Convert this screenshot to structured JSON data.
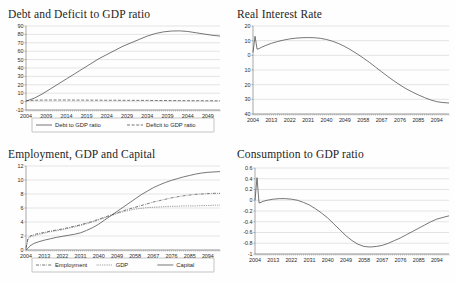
{
  "page": {
    "background": "#fefefe",
    "layout": "2x2 chart grid"
  },
  "panels": [
    {
      "id": "debt",
      "title": "Debt and Deficit to GDP ratio"
    },
    {
      "id": "rir",
      "title": "Real Interest Rate"
    },
    {
      "id": "egc",
      "title": "Employment, GDP and Capital"
    },
    {
      "id": "cgdp",
      "title": "Consumption to GDP ratio"
    }
  ],
  "chart_data": [
    {
      "id": "debt",
      "type": "line",
      "title": "Debt and Deficit to GDP ratio",
      "xlabel": "",
      "ylabel": "",
      "grid": true,
      "legend_position": "below",
      "xlim": [
        2004,
        2052
      ],
      "ylim": [
        -10,
        90
      ],
      "yticks": [
        -10,
        0,
        10,
        20,
        30,
        40,
        50,
        60,
        70,
        80,
        90
      ],
      "xticks": [
        2004,
        2009,
        2014,
        2019,
        2024,
        2029,
        2034,
        2039,
        2044,
        2049
      ],
      "x": [
        2004,
        2006,
        2008,
        2010,
        2012,
        2014,
        2016,
        2018,
        2020,
        2022,
        2024,
        2026,
        2028,
        2030,
        2032,
        2034,
        2036,
        2038,
        2040,
        2042,
        2044,
        2046,
        2048,
        2050,
        2052
      ],
      "series": [
        {
          "name": "Debt to GDP ratio",
          "style": "solid",
          "values": [
            0.5,
            4,
            9,
            15,
            21,
            27,
            33,
            39,
            45,
            51,
            56,
            61,
            66,
            70,
            74,
            78,
            81,
            83,
            84,
            84.2,
            83.5,
            82,
            80.5,
            79,
            78
          ]
        },
        {
          "name": "Deficit to GDP ratio",
          "style": "dashed",
          "values": [
            1.2,
            1.6,
            1.8,
            1.9,
            1.9,
            1.9,
            1.8,
            1.8,
            1.7,
            1.7,
            1.6,
            1.6,
            1.5,
            1.5,
            1.4,
            1.4,
            1.3,
            1.3,
            1.2,
            1.2,
            1.1,
            1.1,
            1.0,
            1.0,
            0.9
          ]
        }
      ]
    },
    {
      "id": "rir",
      "type": "line",
      "title": "Real Interest Rate",
      "xlabel": "",
      "ylabel": "",
      "grid": true,
      "legend_position": "none",
      "xlim": [
        2004,
        2100
      ],
      "ylim": [
        -40,
        20
      ],
      "yticks": [
        20,
        10,
        0,
        -10,
        -20,
        -30,
        -40
      ],
      "ytick_labels": [
        "20",
        "10",
        "0",
        "10",
        "20",
        "30",
        "40"
      ],
      "xticks": [
        2004,
        2013,
        2022,
        2031,
        2040,
        2049,
        2058,
        2067,
        2076,
        2085,
        2094
      ],
      "x": [
        2004,
        2005,
        2006,
        2007,
        2008,
        2010,
        2013,
        2016,
        2019,
        2022,
        2025,
        2028,
        2031,
        2034,
        2037,
        2040,
        2043,
        2046,
        2049,
        2052,
        2055,
        2058,
        2061,
        2064,
        2067,
        2070,
        2073,
        2076,
        2079,
        2082,
        2085,
        2088,
        2091,
        2094,
        2097,
        2100
      ],
      "series": [
        {
          "name": "Real Interest Rate",
          "style": "solid",
          "values": [
            2.0,
            13.0,
            4.2,
            4.6,
            5.4,
            6.6,
            8.2,
            9.4,
            10.4,
            11.2,
            11.7,
            12.0,
            12.1,
            12.0,
            11.6,
            10.8,
            9.6,
            8.0,
            6.0,
            3.6,
            1.0,
            -1.8,
            -4.8,
            -8.0,
            -11.2,
            -14.4,
            -17.4,
            -20.2,
            -22.8,
            -25.0,
            -27.0,
            -28.8,
            -30.4,
            -31.6,
            -32.2,
            -32.5
          ]
        }
      ]
    },
    {
      "id": "egc",
      "type": "line",
      "title": "Employment, GDP and Capital",
      "xlabel": "",
      "ylabel": "",
      "grid": true,
      "legend_position": "below",
      "xlim": [
        2004,
        2100
      ],
      "ylim": [
        0,
        12
      ],
      "yticks": [
        0,
        2,
        4,
        6,
        8,
        10,
        12
      ],
      "xticks": [
        2004,
        2013,
        2022,
        2031,
        2040,
        2049,
        2058,
        2067,
        2076,
        2085,
        2094
      ],
      "x": [
        2004,
        2005,
        2006,
        2008,
        2010,
        2013,
        2016,
        2019,
        2022,
        2025,
        2028,
        2031,
        2034,
        2037,
        2040,
        2043,
        2046,
        2049,
        2052,
        2055,
        2058,
        2061,
        2064,
        2067,
        2070,
        2073,
        2076,
        2079,
        2082,
        2085,
        2088,
        2091,
        2094,
        2097,
        2100
      ],
      "series": [
        {
          "name": "Employment",
          "style": "dashdot",
          "values": [
            0.3,
            1.7,
            2.0,
            2.2,
            2.35,
            2.5,
            2.7,
            2.85,
            3.0,
            3.2,
            3.4,
            3.6,
            3.85,
            4.1,
            4.4,
            4.7,
            5.0,
            5.3,
            5.6,
            5.85,
            6.1,
            6.35,
            6.6,
            6.85,
            7.05,
            7.25,
            7.45,
            7.6,
            7.75,
            7.85,
            7.95,
            8.0,
            8.05,
            8.1,
            8.1
          ]
        },
        {
          "name": "GDP",
          "style": "dotted",
          "values": [
            0.2,
            1.5,
            1.85,
            2.05,
            2.2,
            2.4,
            2.6,
            2.75,
            2.9,
            3.1,
            3.3,
            3.5,
            3.75,
            4.0,
            4.3,
            4.6,
            4.9,
            5.2,
            5.45,
            5.65,
            5.85,
            5.95,
            6.05,
            6.1,
            6.15,
            6.2,
            6.25,
            6.25,
            6.3,
            6.3,
            6.3,
            6.35,
            6.35,
            6.4,
            6.4
          ]
        },
        {
          "name": "Capital",
          "style": "solid",
          "values": [
            0.0,
            0.25,
            0.6,
            0.95,
            1.15,
            1.4,
            1.6,
            1.8,
            1.95,
            2.1,
            2.25,
            2.45,
            2.8,
            3.2,
            3.7,
            4.3,
            4.9,
            5.5,
            6.1,
            6.7,
            7.3,
            7.9,
            8.4,
            8.9,
            9.3,
            9.65,
            9.95,
            10.2,
            10.45,
            10.65,
            10.85,
            11.0,
            11.1,
            11.15,
            11.2
          ]
        }
      ]
    },
    {
      "id": "cgdp",
      "type": "line",
      "title": "Consumption to GDP ratio",
      "xlabel": "",
      "ylabel": "",
      "grid": true,
      "legend_position": "none",
      "xlim": [
        2004,
        2100
      ],
      "ylim": [
        -1,
        0.6
      ],
      "yticks": [
        0.6,
        0.4,
        0.2,
        0,
        -0.2,
        -0.4,
        -0.6,
        -0.8,
        -1
      ],
      "ytick_labels": [
        "0.6",
        "0.4",
        "0.2",
        "0",
        "-0.2",
        "-0.4",
        "-0.6",
        "-0.8",
        "-1"
      ],
      "xticks": [
        2004,
        2013,
        2022,
        2031,
        2040,
        2049,
        2058,
        2067,
        2076,
        2085,
        2094
      ],
      "x": [
        2004,
        2005,
        2006,
        2007,
        2008,
        2010,
        2013,
        2016,
        2019,
        2022,
        2025,
        2028,
        2031,
        2034,
        2037,
        2040,
        2043,
        2046,
        2049,
        2052,
        2055,
        2058,
        2061,
        2064,
        2067,
        2070,
        2073,
        2076,
        2079,
        2082,
        2085,
        2088,
        2091,
        2094,
        2097,
        2100
      ],
      "series": [
        {
          "name": "Consumption to GDP ratio",
          "style": "solid",
          "values": [
            0.0,
            0.42,
            -0.05,
            -0.04,
            -0.02,
            0.0,
            0.02,
            0.03,
            0.03,
            0.02,
            0.0,
            -0.04,
            -0.09,
            -0.16,
            -0.24,
            -0.33,
            -0.44,
            -0.55,
            -0.66,
            -0.75,
            -0.82,
            -0.86,
            -0.87,
            -0.86,
            -0.84,
            -0.8,
            -0.75,
            -0.7,
            -0.64,
            -0.58,
            -0.52,
            -0.46,
            -0.4,
            -0.35,
            -0.32,
            -0.29
          ]
        }
      ]
    }
  ],
  "legends": {
    "debt": [
      {
        "label": "Debt to GDP ratio",
        "style": "solid"
      },
      {
        "label": "Deficit to GDP ratio",
        "style": "dashed"
      }
    ],
    "egc": [
      {
        "label": "Employment",
        "style": "dashdot"
      },
      {
        "label": "GDP",
        "style": "dotted"
      },
      {
        "label": "Capital",
        "style": "solid"
      }
    ]
  }
}
